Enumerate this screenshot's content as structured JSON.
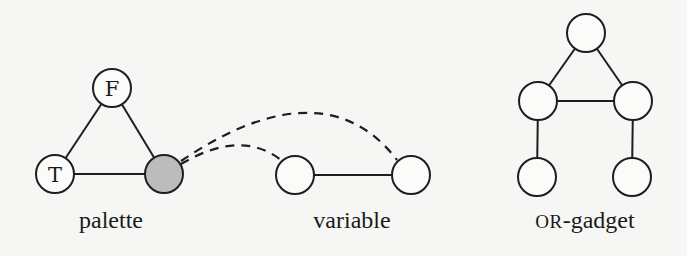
{
  "figure": {
    "colors": {
      "background": "#f6f6f4",
      "stroke": "#1e1e1e",
      "node_fill": "#fbfbf9",
      "shaded_fill": "#bcbcbc"
    },
    "gadgets": [
      {
        "id": "palette",
        "caption": "palette",
        "nodes": [
          {
            "id": "F",
            "label": "F",
            "cx": 112,
            "cy": 88,
            "r": 19,
            "shaded": false
          },
          {
            "id": "T",
            "label": "T",
            "cx": 55,
            "cy": 174,
            "r": 19,
            "shaded": false
          },
          {
            "id": "X",
            "label": "",
            "cx": 164,
            "cy": 174,
            "r": 19,
            "shaded": true
          }
        ],
        "edges": [
          [
            "F",
            "T"
          ],
          [
            "F",
            "X"
          ],
          [
            "T",
            "X"
          ]
        ]
      },
      {
        "id": "variable",
        "caption": "variable",
        "nodes": [
          {
            "id": "v1",
            "label": "",
            "cx": 295,
            "cy": 175,
            "r": 19,
            "shaded": false
          },
          {
            "id": "v2",
            "label": "",
            "cx": 411,
            "cy": 175,
            "r": 19,
            "shaded": false
          }
        ],
        "edges": [
          [
            "v1",
            "v2"
          ]
        ]
      },
      {
        "id": "or-gadget",
        "caption_smallcaps": "OR",
        "caption_rest": "-gadget",
        "nodes": [
          {
            "id": "top",
            "label": "",
            "cx": 586,
            "cy": 33,
            "r": 19,
            "shaded": false
          },
          {
            "id": "ml",
            "label": "",
            "cx": 538,
            "cy": 101,
            "r": 19,
            "shaded": false
          },
          {
            "id": "mr",
            "label": "",
            "cx": 633,
            "cy": 101,
            "r": 19,
            "shaded": false
          },
          {
            "id": "bl",
            "label": "",
            "cx": 537,
            "cy": 177,
            "r": 19,
            "shaded": false
          },
          {
            "id": "br",
            "label": "",
            "cx": 632,
            "cy": 177,
            "r": 19,
            "shaded": false
          }
        ],
        "edges": [
          [
            "top",
            "ml"
          ],
          [
            "top",
            "mr"
          ],
          [
            "ml",
            "mr"
          ],
          [
            "ml",
            "bl"
          ],
          [
            "mr",
            "br"
          ]
        ]
      }
    ],
    "dashed_connections": [
      {
        "from": "X",
        "to": "v1",
        "path": "M 181 164 C 205 150, 245 132, 281 160"
      },
      {
        "from": "X",
        "to": "v2",
        "path": "M 181 161 C 230 128, 330 72, 397 160"
      }
    ]
  }
}
